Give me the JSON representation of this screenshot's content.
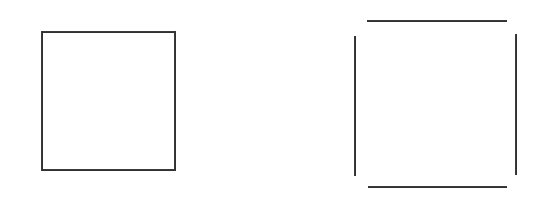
{
  "figure": {
    "background_color": "#ffffff",
    "stroke_color": "#3a3a3a",
    "stroke_width_px": 2,
    "canvas": {
      "width": 543,
      "height": 200
    },
    "panels": [
      {
        "id": "closed-square",
        "name": "Closed square",
        "description": "A complete square outline drawn with four connected continuous edges and no gaps at the corners.",
        "bounds": {
          "x": 41,
          "y": 31,
          "width": 135,
          "height": 140
        },
        "segments": [
          {
            "name": "top-edge",
            "orientation": "horizontal",
            "x": 41,
            "y": 31,
            "length": 135
          },
          {
            "name": "bottom-edge",
            "orientation": "horizontal",
            "x": 41,
            "y": 169,
            "length": 135
          },
          {
            "name": "left-edge",
            "orientation": "vertical",
            "x": 41,
            "y": 31,
            "length": 140
          },
          {
            "name": "right-edge",
            "orientation": "vertical",
            "x": 174,
            "y": 31,
            "length": 140
          }
        ]
      },
      {
        "id": "open-square",
        "name": "Open square with corner gaps",
        "description": "Four separate straight line segments arranged as a square; the corners are not joined, leaving visible gaps.",
        "bounds": {
          "x": 354,
          "y": 20,
          "width": 163,
          "height": 168
        },
        "segments": [
          {
            "name": "top-segment",
            "orientation": "horizontal",
            "x": 367,
            "y": 20,
            "length": 140
          },
          {
            "name": "bottom-segment",
            "orientation": "horizontal",
            "x": 368,
            "y": 186,
            "length": 139
          },
          {
            "name": "left-segment",
            "orientation": "vertical",
            "x": 354,
            "y": 36,
            "length": 140
          },
          {
            "name": "right-segment",
            "orientation": "vertical",
            "x": 515,
            "y": 34,
            "length": 141
          }
        ]
      }
    ]
  }
}
